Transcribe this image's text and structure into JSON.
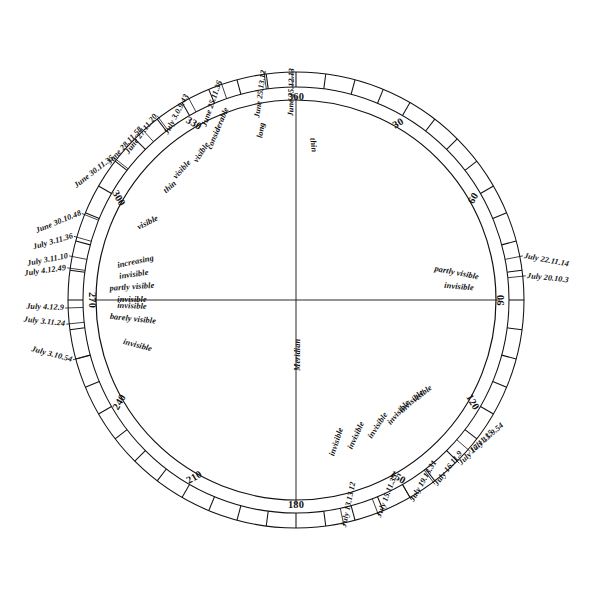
{
  "figure": {
    "center_x": 296,
    "center_y": 300,
    "outer_radius": 228,
    "ring_inner_radius": 213,
    "inner_circle_radius": 200,
    "ink_color": "#111111",
    "background": "#ffffff",
    "zero_degree_label": "360"
  },
  "degree_marks": [
    {
      "label": "180",
      "deg": 180
    },
    {
      "label": "210",
      "deg": 210
    },
    {
      "label": "240",
      "deg": 240
    },
    {
      "label": "270",
      "deg": 270
    },
    {
      "label": "300",
      "deg": 300
    },
    {
      "label": "330",
      "deg": 330
    },
    {
      "label": "360",
      "deg": 0
    },
    {
      "label": "30",
      "deg": 30
    },
    {
      "label": "60",
      "deg": 60
    },
    {
      "label": "90",
      "deg": 90
    },
    {
      "label": "120",
      "deg": 120
    },
    {
      "label": "150",
      "deg": 150
    }
  ],
  "axis_label": "Meridian",
  "outer_dates": [
    {
      "text": "July 13.13.12",
      "deg": 168
    },
    {
      "text": "July 15.11.35",
      "deg": 159
    },
    {
      "text": "July 19.13.31",
      "deg": 150
    },
    {
      "text": "July 16.11.9",
      "deg": 143
    },
    {
      "text": "July 17.11.15",
      "deg": 135
    },
    {
      "text": "July 15.9.54",
      "deg": 131
    },
    {
      "text": "July 20.10.3",
      "deg": 84
    },
    {
      "text": "July 22.11.14",
      "deg": 79
    },
    {
      "text": "June 25.13.12",
      "deg": 352
    },
    {
      "text": "June 25.12.13",
      "deg": 359
    },
    {
      "text": "June 25.11.36",
      "deg": 341
    },
    {
      "text": "July 3.0.9.43",
      "deg": 332
    },
    {
      "text": "June 27.11.20",
      "deg": 323
    },
    {
      "text": "June 28.11.58",
      "deg": 318
    },
    {
      "text": "June 30.11.35",
      "deg": 308
    },
    {
      "text": "June 30.10.48",
      "deg": 292
    },
    {
      "text": "July 3.11.36",
      "deg": 286
    },
    {
      "text": "July 3.11.10",
      "deg": 281
    },
    {
      "text": "July 4.12.49",
      "deg": 278
    },
    {
      "text": "July 4.12.9",
      "deg": 268
    },
    {
      "text": "July 3.11.24",
      "deg": 264
    },
    {
      "text": "July 3.10.54",
      "deg": 255
    }
  ],
  "inner_notes": [
    {
      "text": "invisible",
      "deg": 162
    },
    {
      "text": "invisible",
      "deg": 155
    },
    {
      "text": "invisible",
      "deg": 147
    },
    {
      "text": "invisible",
      "deg": 139
    },
    {
      "text": "invisible",
      "deg": 133
    },
    {
      "text": "visible",
      "deg": 128
    },
    {
      "text": "invisible",
      "deg": 85
    },
    {
      "text": "partly visible",
      "deg": 79
    },
    {
      "text": "invisible",
      "deg": 255
    },
    {
      "text": "invisible",
      "deg": 268
    },
    {
      "text": "barely visible",
      "deg": 264
    },
    {
      "text": "increasing",
      "deg": 282
    },
    {
      "text": "invisible",
      "deg": 278
    },
    {
      "text": "partly visible",
      "deg": 274
    },
    {
      "text": "invisible",
      "deg": 270
    },
    {
      "text": "visible",
      "deg": 296
    },
    {
      "text": "thin",
      "deg": 311
    },
    {
      "text": "visible",
      "deg": 318
    },
    {
      "text": "visible",
      "deg": 327
    },
    {
      "text": "considerable",
      "deg": 337
    },
    {
      "text": "long",
      "deg": 350
    },
    {
      "text": "thin",
      "deg": 8
    }
  ]
}
